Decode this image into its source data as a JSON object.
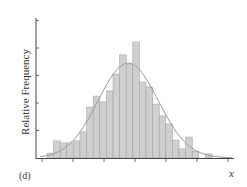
{
  "chart_data": {
    "type": "bar",
    "subtype": "histogram_with_density_curve",
    "title": "",
    "panel_label": "(d)",
    "xlabel": "x",
    "ylabel": "Relative Frequency",
    "x_tick_labels": [],
    "y_tick_labels": [],
    "y_units_note": "values expressed in units of y-axis tick spacing (no numeric tick labels shown)",
    "ylim": [
      0,
      5.3
    ],
    "grid": false,
    "legend": null,
    "bin_count": 25,
    "values": [
      0.18,
      0.62,
      0.55,
      0.55,
      0.62,
      0.95,
      1.85,
      2.25,
      2.04,
      2.44,
      3.05,
      3.75,
      3.42,
      4.22,
      2.76,
      2.58,
      1.96,
      1.53,
      1.24,
      0.65,
      0.33,
      0.76,
      0.25,
      0.0,
      0.15
    ],
    "x_ticks_count": 7,
    "y_ticks_count": 5,
    "curve": {
      "type": "normal density overlay",
      "peak_bin_index": 12.3,
      "peak_value": 3.45
    },
    "colors": {
      "bar_fill": "#cfcfcf",
      "bar_edge": "#9a9a9a",
      "curve": "#9a9a9a",
      "axis": "#444444"
    }
  }
}
